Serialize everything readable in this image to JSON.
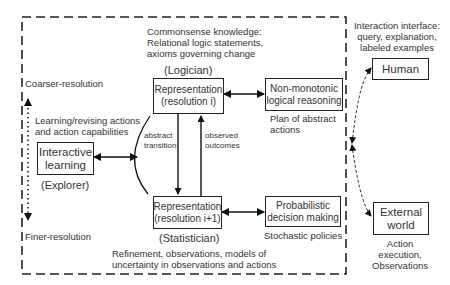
{
  "diagram": {
    "frame": {
      "style": "dashed"
    },
    "top_note": [
      "Commonsense knowledge:",
      "Relational logic statements,",
      "axioms governing change"
    ],
    "logician_label": "(Logician)",
    "statistician_label": "(Statistician)",
    "explorer_label": "(Explorer)",
    "bottom_note": [
      "Refinement, observations, models of",
      "uncertainty in observations and actions"
    ],
    "resolution_axis": {
      "top": "Coarser-resolution",
      "bottom": "Finer-resolution"
    },
    "learning_note": [
      "Learning/revising actions",
      "and action capabilities"
    ],
    "edge_labels": {
      "abstract_transition": [
        "abstract",
        "transition"
      ],
      "observed_outcomes": [
        "observed",
        "outcomes"
      ]
    },
    "nodes": {
      "rep_coarse": [
        "Representation",
        "(resolution i)"
      ],
      "rep_fine": [
        "Representation",
        "(resolution i+1)"
      ],
      "nonmonotonic": [
        "Non-monotonic",
        "logical reasoning"
      ],
      "probabilistic": [
        "Probabilistic",
        "decision making"
      ],
      "interactive": [
        "Interactive",
        "learning"
      ],
      "human": [
        "Human"
      ],
      "external": [
        "External",
        "world"
      ]
    },
    "output_notes": {
      "plan": [
        "Plan of abstract",
        "actions"
      ],
      "stochastic": [
        "Stochastic policies"
      ]
    },
    "interaction_note": [
      "Interaction interface:",
      "query, explanation,",
      "labeled examples"
    ],
    "external_note": [
      "Action",
      "execution,",
      "Observations"
    ]
  }
}
